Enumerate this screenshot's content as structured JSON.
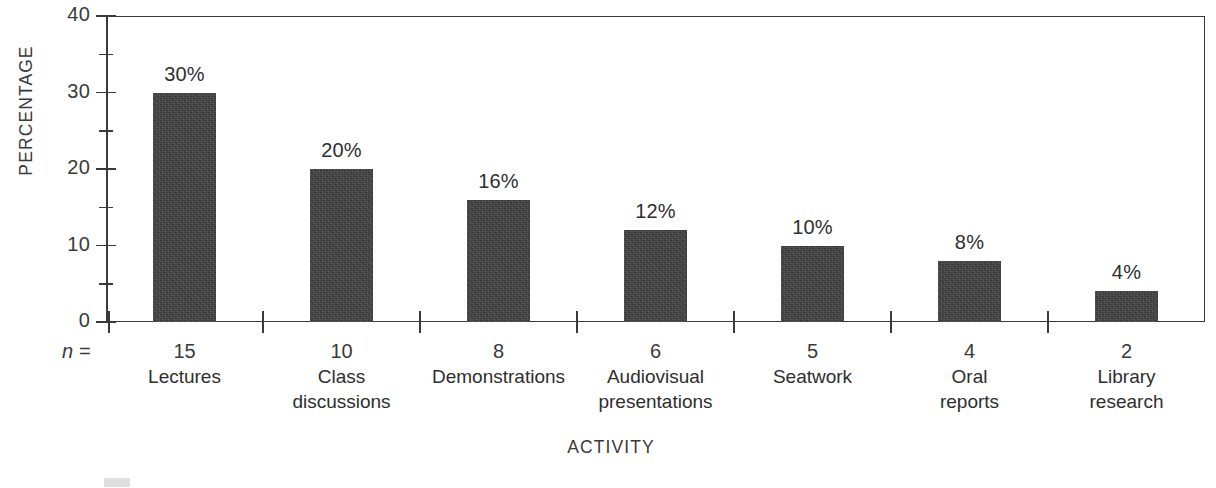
{
  "chart_data": {
    "type": "bar",
    "title": "",
    "xlabel": "ACTIVITY",
    "ylabel": "PERCENTAGE",
    "categories": [
      "Lectures",
      "Class discussions",
      "Demonstrations",
      "Audiovisual presentations",
      "Seatwork",
      "Oral reports",
      "Library research"
    ],
    "values": [
      30,
      20,
      16,
      12,
      10,
      8,
      4
    ],
    "value_labels": [
      "30%",
      "20%",
      "16%",
      "12%",
      "10%",
      "8%",
      "4%"
    ],
    "n_values": [
      15,
      10,
      8,
      6,
      5,
      4,
      2
    ],
    "n_prefix": "n =",
    "ylim": [
      0,
      40
    ],
    "ytick_major": [
      0,
      10,
      20,
      30,
      40
    ],
    "ytick_minor": [
      5,
      15,
      25,
      35
    ],
    "ytick_labels": [
      "0",
      "10",
      "20",
      "30",
      "40"
    ],
    "grid": false,
    "legend": "none",
    "bar_color": "#414141",
    "axis_color": "#3a3a3a",
    "text_color": "#2e2e2e"
  },
  "axis": {
    "y_title": "PERCENTAGE",
    "x_title": "ACTIVITY"
  },
  "categories": [
    {
      "name_line1": "Lectures",
      "name_line2": "",
      "n": "15",
      "value_label": "30%"
    },
    {
      "name_line1": "Class",
      "name_line2": "discussions",
      "n": "10",
      "value_label": "20%"
    },
    {
      "name_line1": "Demonstrations",
      "name_line2": "",
      "n": "8",
      "value_label": "16%"
    },
    {
      "name_line1": "Audiovisual",
      "name_line2": "presentations",
      "n": "6",
      "value_label": "12%"
    },
    {
      "name_line1": "Seatwork",
      "name_line2": "",
      "n": "5",
      "value_label": "10%"
    },
    {
      "name_line1": "Oral",
      "name_line2": "reports",
      "n": "4",
      "value_label": "8%"
    },
    {
      "name_line1": "Library",
      "name_line2": "research",
      "n": "2",
      "value_label": "4%"
    }
  ],
  "n_label": "n =",
  "caption": {
    "text": ""
  }
}
